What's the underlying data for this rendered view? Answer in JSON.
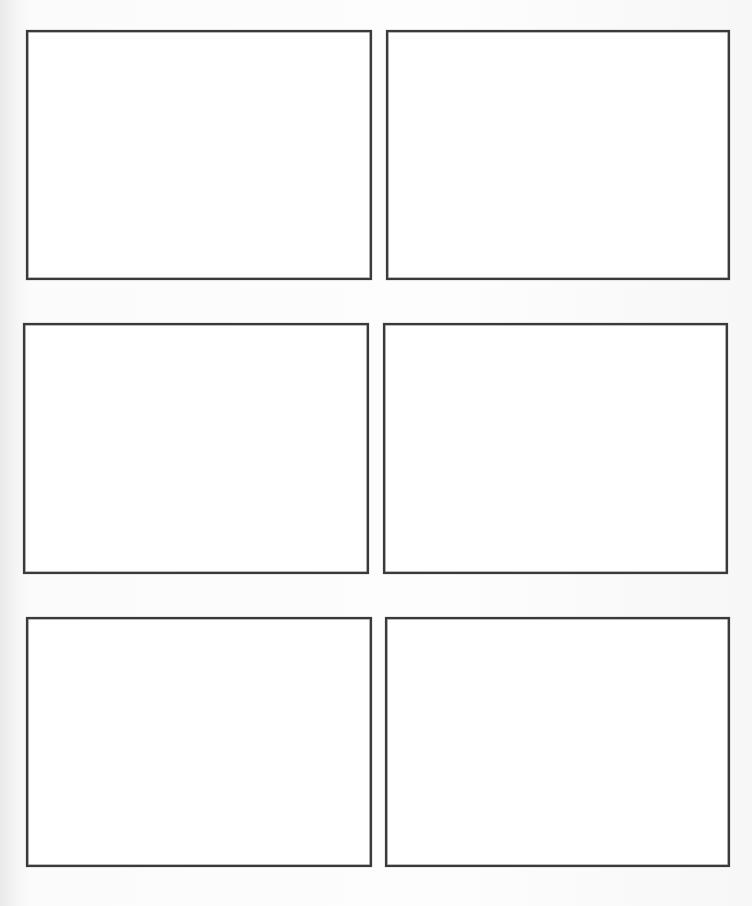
{
  "page": {
    "type": "blank comic/storyboard template",
    "layout": "3 rows x 2 columns",
    "background_color": "#fbfbfb",
    "frame_color": "#3a3a3a"
  },
  "panels": [
    {
      "id": 1,
      "label": "Panel 1",
      "x": 26,
      "y": 30,
      "w": 346,
      "h": 250
    },
    {
      "id": 2,
      "label": "Panel 2",
      "x": 386,
      "y": 30,
      "w": 344,
      "h": 250
    },
    {
      "id": 3,
      "label": "Panel 3",
      "x": 23,
      "y": 323,
      "w": 346,
      "h": 251
    },
    {
      "id": 4,
      "label": "Panel 4",
      "x": 383,
      "y": 323,
      "w": 345,
      "h": 251
    },
    {
      "id": 5,
      "label": "Panel 5",
      "x": 26,
      "y": 617,
      "w": 346,
      "h": 250
    },
    {
      "id": 6,
      "label": "Panel 6",
      "x": 385,
      "y": 617,
      "w": 345,
      "h": 250
    }
  ]
}
